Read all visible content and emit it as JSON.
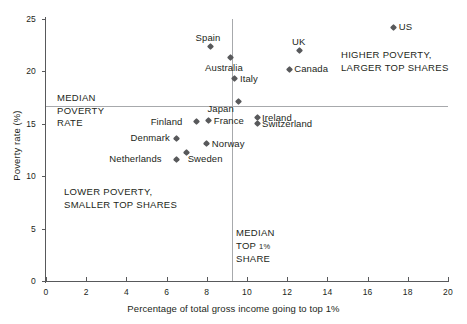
{
  "chart_data": {
    "type": "scatter",
    "title": "",
    "xlabel": "Percentage of total gross income going to top 1%",
    "ylabel": "Poverty rate (%)",
    "xlim": [
      0,
      20
    ],
    "ylim": [
      0,
      25
    ],
    "xticks": [
      0,
      2,
      4,
      6,
      8,
      10,
      12,
      14,
      16,
      18,
      20
    ],
    "yticks": [
      0,
      5,
      10,
      15,
      20,
      25
    ],
    "grid": false,
    "legend": "none",
    "points": [
      {
        "label": "US",
        "x": 17.3,
        "y": 24.2,
        "label_pos": "right"
      },
      {
        "label": "Spain",
        "x": 8.2,
        "y": 22.4,
        "label_pos": "above"
      },
      {
        "label": "UK",
        "x": 12.6,
        "y": 22.0,
        "label_pos": "above"
      },
      {
        "label": "Australia",
        "x": 9.2,
        "y": 21.3,
        "label_pos": "below"
      },
      {
        "label": "Canada",
        "x": 12.1,
        "y": 20.2,
        "label_pos": "right"
      },
      {
        "label": "Italy",
        "x": 9.4,
        "y": 19.3,
        "label_pos": "right"
      },
      {
        "label": "Japan",
        "x": 9.6,
        "y": 17.1,
        "label_pos": "below-left"
      },
      {
        "label": "Ireland",
        "x": 10.5,
        "y": 15.6,
        "label_pos": "right"
      },
      {
        "label": "Finland",
        "x": 7.5,
        "y": 15.2,
        "label_pos": "left"
      },
      {
        "label": "France",
        "x": 8.1,
        "y": 15.3,
        "label_pos": "right"
      },
      {
        "label": "Switzerland",
        "x": 10.5,
        "y": 15.0,
        "label_pos": "right"
      },
      {
        "label": "Denmark",
        "x": 6.5,
        "y": 13.6,
        "label_pos": "left"
      },
      {
        "label": "Norway",
        "x": 8.0,
        "y": 13.1,
        "label_pos": "right"
      },
      {
        "label": "Sweden",
        "x": 7.0,
        "y": 12.3,
        "label_pos": "below-right"
      },
      {
        "label": "Netherlands",
        "x": 6.5,
        "y": 11.6,
        "label_pos": "left"
      }
    ],
    "reference_lines": [
      {
        "orientation": "horizontal",
        "value": 16.7,
        "name": "median-poverty-rate"
      },
      {
        "orientation": "vertical",
        "value": 9.25,
        "name": "median-top-1-share"
      }
    ],
    "annotations": {
      "median_poverty": "MEDIAN\nPOVERTY\nRATE",
      "median_top_share_line1": "MEDIAN",
      "median_top_share_line2a": "TOP ",
      "median_top_share_line2b": "1%",
      "median_top_share_line3": "SHARE",
      "higher_poverty": "HIGHER POVERTY,\nLARGER TOP SHARES",
      "lower_poverty": "LOWER POVERTY,\nSMALLER TOP SHARES"
    },
    "colors": {
      "marker": "#58595b",
      "axis": "#58595b",
      "reference_line": "#a7a9ac",
      "text": "#231f20",
      "background": "#ffffff"
    }
  }
}
